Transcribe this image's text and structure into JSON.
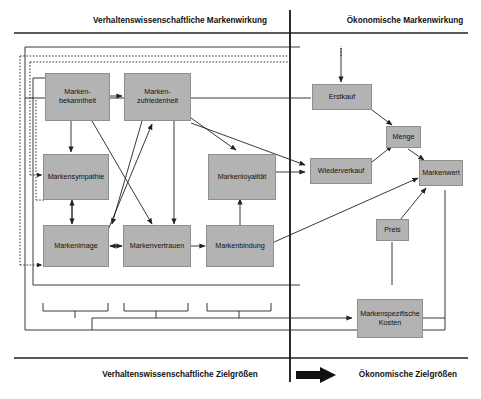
{
  "figure": {
    "title_left": "Verhaltenswissenschaftliche Markenwirkung",
    "title_right": "Ökonomische Markenwirkung",
    "footer_left": "Verhaltenswissenschaftliche Zielgrößen",
    "footer_right": "Ökonomische Zielgrößen",
    "box_fill": "#b3b3b3",
    "line_color": "#222222"
  },
  "nodes": {
    "markenbekanntheit": "Marken-\nbekanntheit",
    "markenbekanntheit_l1": "Marken-",
    "markenbekanntheit_l2": "bekanntheit",
    "markenzufriedenheit_l1": "Marken-",
    "markenzufriedenheit_l2": "zufriedenheit",
    "markensympathie": "Markensympathie",
    "markenloyalitaet": "Markenloyalität",
    "markenimage": "Markenimage",
    "markenvertrauen": "Markenvertrauen",
    "markenbindung": "Markenbindung",
    "erstkauf": "Erstkauf",
    "wiederverkauf": "Wiederverkauf",
    "menge": "Menge",
    "preis": "Preis",
    "markenwert": "Markenwert",
    "markenspezifische_kosten_l1": "Markenspezifische",
    "markenspezifische_kosten_l2": "Kosten"
  }
}
